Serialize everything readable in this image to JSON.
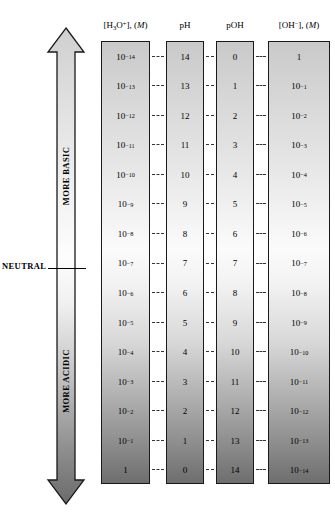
{
  "diagram": {
    "axis_arrow": {
      "name": "acidity-basicity-arrow",
      "top_label": "MORE BASIC",
      "bottom_label": "MORE ACIDIC",
      "midpoint_label": "NEUTRAL"
    },
    "columns": [
      {
        "id": "h3o",
        "header_html": "[H<sub>3</sub>O<sup>+</sup>], (<i>M</i>)",
        "header_text": "[H3O+], (M)"
      },
      {
        "id": "ph",
        "header_html": "pH",
        "header_text": "pH"
      },
      {
        "id": "poh",
        "header_html": "pOH",
        "header_text": "pOH"
      },
      {
        "id": "oh",
        "header_html": "[OH<sup>&minus;</sup>], (<i>M</i>)",
        "header_text": "[OH-], (M)"
      }
    ]
  },
  "chart_data": {
    "type": "table",
    "categories": [
      "[H3O+], (M)",
      "pH",
      "pOH",
      "[OH-], (M)"
    ],
    "neutral_row_index": 7,
    "rows": [
      {
        "h3o": "10⁻¹⁴",
        "h3o_exp": -14,
        "ph": "14",
        "poh": "0",
        "oh": "1",
        "oh_exp": 0
      },
      {
        "h3o": "10⁻¹³",
        "h3o_exp": -13,
        "ph": "13",
        "poh": "1",
        "oh": "10⁻¹",
        "oh_exp": -1
      },
      {
        "h3o": "10⁻¹²",
        "h3o_exp": -12,
        "ph": "12",
        "poh": "2",
        "oh": "10⁻²",
        "oh_exp": -2
      },
      {
        "h3o": "10⁻¹¹",
        "h3o_exp": -11,
        "ph": "11",
        "poh": "3",
        "oh": "10⁻³",
        "oh_exp": -3
      },
      {
        "h3o": "10⁻¹⁰",
        "h3o_exp": -10,
        "ph": "10",
        "poh": "4",
        "oh": "10⁻⁴",
        "oh_exp": -4
      },
      {
        "h3o": "10⁻⁹",
        "h3o_exp": -9,
        "ph": "9",
        "poh": "5",
        "oh": "10⁻⁵",
        "oh_exp": -5
      },
      {
        "h3o": "10⁻⁸",
        "h3o_exp": -8,
        "ph": "8",
        "poh": "6",
        "oh": "10⁻⁶",
        "oh_exp": -6
      },
      {
        "h3o": "10⁻⁷",
        "h3o_exp": -7,
        "ph": "7",
        "poh": "7",
        "oh": "10⁻⁷",
        "oh_exp": -7
      },
      {
        "h3o": "10⁻⁶",
        "h3o_exp": -6,
        "ph": "6",
        "poh": "8",
        "oh": "10⁻⁸",
        "oh_exp": -8
      },
      {
        "h3o": "10⁻⁵",
        "h3o_exp": -5,
        "ph": "5",
        "poh": "9",
        "oh": "10⁻⁹",
        "oh_exp": -9
      },
      {
        "h3o": "10⁻⁴",
        "h3o_exp": -4,
        "ph": "4",
        "poh": "10",
        "oh": "10⁻¹⁰",
        "oh_exp": -10
      },
      {
        "h3o": "10⁻³",
        "h3o_exp": -3,
        "ph": "3",
        "poh": "11",
        "oh": "10⁻¹¹",
        "oh_exp": -11
      },
      {
        "h3o": "10⁻²",
        "h3o_exp": -2,
        "ph": "2",
        "poh": "12",
        "oh": "10⁻¹²",
        "oh_exp": -12
      },
      {
        "h3o": "10⁻¹",
        "h3o_exp": -1,
        "ph": "1",
        "poh": "13",
        "oh": "10⁻¹³",
        "oh_exp": -13
      },
      {
        "h3o": "1",
        "h3o_exp": 0,
        "ph": "0",
        "poh": "14",
        "oh": "10⁻¹⁴",
        "oh_exp": -14
      }
    ]
  },
  "colors": {
    "basic_end": "#c9c9c9",
    "neutral_mid": "#fbfbfb",
    "acidic_end": "#6e6e6e",
    "border": "#1a1a1a",
    "text": "#000000"
  }
}
